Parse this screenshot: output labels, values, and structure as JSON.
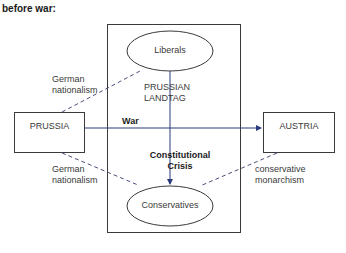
{
  "title": "before war:",
  "nodes": {
    "prussia": "PRUSSIA",
    "austria": "AUSTRIA",
    "liberals": "Liberals",
    "conservatives": "Conservatives",
    "landtag_line1": "PRUSSIAN",
    "landtag_line2": "LANDTAG"
  },
  "edges": {
    "war": "War",
    "crisis_line1": "Constitutional",
    "crisis_line2": "Crisis",
    "german_nat_top_line1": "German",
    "german_nat_top_line2": "nationalism",
    "german_nat_bottom_line1": "German",
    "german_nat_bottom_line2": "nationalism",
    "cons_mon_line1": "conservative",
    "cons_mon_line2": "monarchism"
  },
  "colors": {
    "arrow": "#2b3a7a",
    "line": "#3a3a3a",
    "dashed": "#4a4f7a"
  }
}
